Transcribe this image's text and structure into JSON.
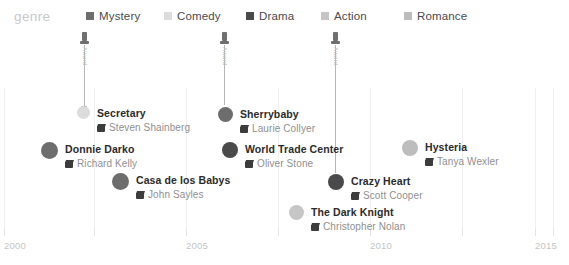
{
  "chart_data": {
    "type": "scatter",
    "title": "",
    "xlabel": "",
    "ylabel": "",
    "xlim": [
      2000,
      2015
    ],
    "x_ticks": [
      "2000",
      "2005",
      "2010",
      "2015"
    ],
    "grid": true,
    "legend_position": "top",
    "legend_title": "genre",
    "categories": [
      "Mystery",
      "Comedy",
      "Drama",
      "Action",
      "Romance"
    ],
    "series": [
      {
        "name": "Mystery",
        "color": "#6d6d6d",
        "points": [
          {
            "title": "Donnie Darko",
            "director": "Richard Kelly",
            "x": 2001,
            "row": 2
          },
          {
            "title": "Casa de los Babys",
            "director": "John Sayles",
            "x": 2003,
            "row": 3
          },
          {
            "title": "Sherrybaby",
            "director": "Laurie Collyer",
            "x": 2006,
            "row": 1
          }
        ]
      },
      {
        "name": "Comedy",
        "color": "#dcdcdc",
        "points": [
          {
            "title": "Secretary",
            "director": "Steven Shainberg",
            "x": 2002,
            "row": 1
          }
        ]
      },
      {
        "name": "Drama",
        "color": "#4a4a4a",
        "points": [
          {
            "title": "World Trade Center",
            "director": "Oliver Stone",
            "x": 2006,
            "row": 2
          },
          {
            "title": "Crazy Heart",
            "director": "Scott Cooper",
            "x": 2009,
            "row": 3
          }
        ]
      },
      {
        "name": "Action",
        "color": "#c6c6c6",
        "points": [
          {
            "title": "The Dark Knight",
            "director": "Christopher Nolan",
            "x": 2008,
            "row": 4
          }
        ]
      },
      {
        "name": "Romance",
        "color": "#bdbdbd",
        "points": [
          {
            "title": "Hysteria",
            "director": "Tanya Wexler",
            "x": 2011,
            "row": 2
          }
        ]
      }
    ],
    "annotations": [
      {
        "label": "Award",
        "x": 2002
      },
      {
        "label": "Award",
        "x": 2006
      },
      {
        "label": "Award",
        "x": 2009
      }
    ]
  },
  "legend": {
    "title": "genre",
    "items": [
      {
        "label": "Mystery",
        "color": "#6d6d6d",
        "left": 86
      },
      {
        "label": "Comedy",
        "color": "#dcdcdc",
        "left": 164
      },
      {
        "label": "Drama",
        "color": "#4a4a4a",
        "left": 246
      },
      {
        "label": "Action",
        "color": "#c6c6c6",
        "left": 321
      },
      {
        "label": "Romance",
        "color": "#bdbdbd",
        "left": 404
      }
    ]
  },
  "axis": {
    "ticks": [
      {
        "label": "2000",
        "left": 4
      },
      {
        "label": "2005",
        "left": 186
      },
      {
        "label": "2010",
        "left": 370
      },
      {
        "label": "2015",
        "left": 535
      }
    ]
  },
  "stems": [
    {
      "label": "Award",
      "left": 84
    },
    {
      "label": "Award",
      "left": 224
    },
    {
      "label": "Award",
      "left": 335
    }
  ],
  "films": [
    {
      "title": "Secretary",
      "director": "Steven Shainberg",
      "color": "#dcdcdc",
      "dot": 13,
      "left": 77,
      "top": 103
    },
    {
      "title": "Donnie Darko",
      "director": "Richard Kelly",
      "color": "#6d6d6d",
      "dot": 17,
      "left": 41,
      "top": 139
    },
    {
      "title": "Casa de los Babys",
      "director": "John Sayles",
      "color": "#6d6d6d",
      "dot": 17,
      "left": 112,
      "top": 170
    },
    {
      "title": "Sherrybaby",
      "director": "Laurie Collyer",
      "color": "#6d6d6d",
      "dot": 15,
      "left": 218,
      "top": 104
    },
    {
      "title": "World Trade Center",
      "director": "Oliver Stone",
      "color": "#4a4a4a",
      "dot": 16,
      "left": 222,
      "top": 139
    },
    {
      "title": "The Dark Knight",
      "director": "Christopher Nolan",
      "color": "#c6c6c6",
      "dot": 15,
      "left": 289,
      "top": 202
    },
    {
      "title": "Crazy Heart",
      "director": "Scott Cooper",
      "color": "#4a4a4a",
      "dot": 16,
      "left": 328,
      "top": 171
    },
    {
      "title": "Hysteria",
      "director": "Tanya Wexler",
      "color": "#bdbdbd",
      "dot": 16,
      "left": 402,
      "top": 137
    }
  ]
}
